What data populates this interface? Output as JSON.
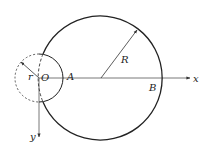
{
  "diagram": {
    "labels": {
      "origin": "O",
      "point_a": "A",
      "point_b": "B",
      "x_axis": "x",
      "y_axis": "y",
      "big_radius": "R",
      "small_radius": "r"
    },
    "colors": {
      "stroke": "#222222",
      "axis": "#555555"
    }
  }
}
